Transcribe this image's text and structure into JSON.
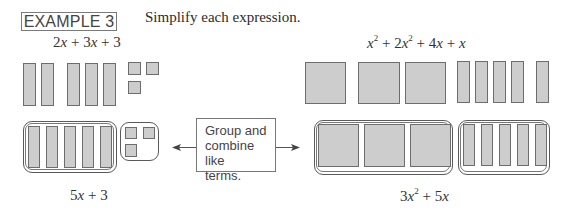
{
  "header": {
    "example_label": "EXAMPLE 3",
    "instruction": "Simplify each expression."
  },
  "left_example": {
    "expression": {
      "parts": [
        "2",
        "x",
        " + 3",
        "x",
        " + 3"
      ],
      "text": "2x + 3x + 3"
    },
    "tiles": {
      "x_bars": 5,
      "unit_squares": 3
    },
    "result": {
      "coef": "5",
      "var": "x",
      "rest": " + 3",
      "text": "5x + 3"
    }
  },
  "center_note": {
    "text": "Group and combine like terms.",
    "lines": [
      "Group and",
      "combine like",
      "terms."
    ]
  },
  "right_example": {
    "expression": {
      "text": "x² + 2x² + 4x + x",
      "t1_var": "x",
      "t1_exp": "2",
      "t2_coef": " + 2",
      "t2_var": "x",
      "t2_exp": "2",
      "t3_coef": " + 4",
      "t3_var": "x",
      "t4_op": " + ",
      "t4_var": "x"
    },
    "tiles": {
      "x_squared_tiles": 3,
      "x_bars": 5
    },
    "result": {
      "text": "3x² + 5x",
      "c1": "3",
      "v1": "x",
      "e1": "2",
      "c2": " + 5",
      "v2": "x"
    }
  },
  "colors": {
    "tile_fill": "#cdcdcd",
    "tile_border": "#6d6d6d",
    "text": "#2b2b2b"
  }
}
